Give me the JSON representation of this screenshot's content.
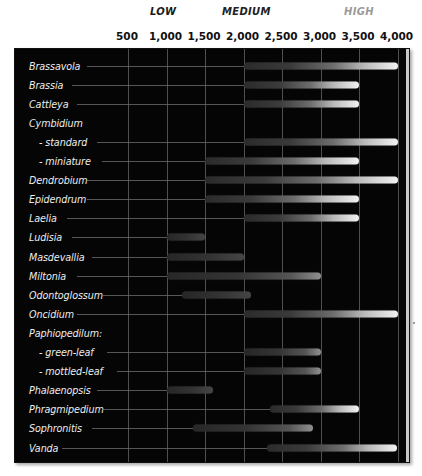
{
  "chart_data": {
    "type": "bar",
    "xlabel": "",
    "ylabel": "",
    "xlim": [
      0,
      4200
    ],
    "grid": true,
    "orientation": "horizontal-range",
    "bands": [
      {
        "label": "LOW",
        "color": "#1a1a1a"
      },
      {
        "label": "MEDIUM",
        "color": "#222222"
      },
      {
        "label": "HIGH",
        "color": "#9a9a9a"
      }
    ],
    "axis_ticks": [
      {
        "label": "500",
        "value": 500
      },
      {
        "label": "1,000",
        "value": 1000
      },
      {
        "label": "1,500",
        "value": 1500
      },
      {
        "label": "2,000",
        "value": 2000
      },
      {
        "label": "2,500",
        "value": 2500
      },
      {
        "label": "3,000",
        "value": 3000
      },
      {
        "label": "3,500",
        "value": 3500
      },
      {
        "label": "4,000",
        "value": 4000
      }
    ],
    "categories": [
      "Brassavola",
      "Brassia",
      "Cattleya",
      "Cymbidium",
      "- standard",
      "- miniature",
      "Dendrobium",
      "Epidendrum",
      "Laelia",
      "Ludisia",
      "Masdevallia",
      "Miltonia",
      "Odontoglossum",
      "Oncidium",
      "Paphiopedilum:",
      "- green-leaf",
      "- mottled-leaf",
      "Phalaenopsis",
      "Phragmipedium",
      "Sophronitis",
      "Vanda"
    ],
    "rows": [
      {
        "label": "Brassavola",
        "indent": false,
        "start": 2000,
        "end": 4000,
        "tone": "bright"
      },
      {
        "label": "Brassia",
        "indent": false,
        "start": 2000,
        "end": 3500,
        "tone": "bright"
      },
      {
        "label": "Cattleya",
        "indent": false,
        "start": 2000,
        "end": 3500,
        "tone": "bright"
      },
      {
        "label": "Cymbidium",
        "indent": false,
        "start": null,
        "end": null,
        "tone": "none"
      },
      {
        "label": "- standard",
        "indent": true,
        "start": 2000,
        "end": 4000,
        "tone": "bright"
      },
      {
        "label": "- miniature",
        "indent": true,
        "start": 1500,
        "end": 3500,
        "tone": "bright"
      },
      {
        "label": "Dendrobium",
        "indent": false,
        "start": 1500,
        "end": 4000,
        "tone": "bright"
      },
      {
        "label": "Epidendrum",
        "indent": false,
        "start": 1500,
        "end": 3500,
        "tone": "bright"
      },
      {
        "label": "Laelia",
        "indent": false,
        "start": 2000,
        "end": 3500,
        "tone": "bright"
      },
      {
        "label": "Ludisia",
        "indent": false,
        "start": 1000,
        "end": 1500,
        "tone": "dark"
      },
      {
        "label": "Masdevallia",
        "indent": false,
        "start": 1000,
        "end": 2000,
        "tone": "dark"
      },
      {
        "label": "Miltonia",
        "indent": false,
        "start": 1000,
        "end": 3000,
        "tone": "mid"
      },
      {
        "label": "Odontoglossum",
        "indent": false,
        "start": 1200,
        "end": 2100,
        "tone": "dark"
      },
      {
        "label": "Oncidium",
        "indent": false,
        "start": 2000,
        "end": 4000,
        "tone": "bright"
      },
      {
        "label": "Paphiopedilum:",
        "indent": false,
        "start": null,
        "end": null,
        "tone": "none"
      },
      {
        "label": "- green-leaf",
        "indent": true,
        "start": 2000,
        "end": 3000,
        "tone": "mid"
      },
      {
        "label": "- mottled-leaf",
        "indent": true,
        "start": 2000,
        "end": 3000,
        "tone": "mid"
      },
      {
        "label": "Phalaenopsis",
        "indent": false,
        "start": 1000,
        "end": 1600,
        "tone": "dark"
      },
      {
        "label": "Phragmipedium",
        "indent": false,
        "start": 2350,
        "end": 3500,
        "tone": "bright"
      },
      {
        "label": "Sophronitis",
        "indent": false,
        "start": 1350,
        "end": 2900,
        "tone": "mid"
      },
      {
        "label": "Vanda",
        "indent": false,
        "start": 2300,
        "end": 4000,
        "tone": "bright"
      }
    ]
  }
}
